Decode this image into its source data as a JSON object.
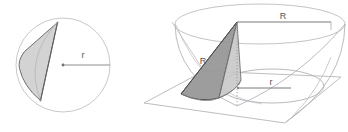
{
  "figure": {
    "background_color": "#ffffff",
    "panels": [
      {
        "id": "left-panel",
        "name": "circle-cross-section",
        "description": "Circle of radius r with inscribed cone cross-section shaded",
        "labels": [
          {
            "id": "radius-label",
            "text": "r",
            "x": 83,
            "y": 58
          }
        ]
      },
      {
        "id": "right-panel",
        "name": "hemisphere-with-cone",
        "description": "Hemispherical bowl of radius R cut by a plane, with inscribed cone",
        "labels": [
          {
            "id": "top-radius-label",
            "text": "R",
            "x": 282,
            "y": 18
          },
          {
            "id": "slant-label",
            "text": "R",
            "x": 203,
            "y": 62
          },
          {
            "id": "inner-radius-label",
            "text": "r",
            "x": 271,
            "y": 87
          }
        ]
      }
    ]
  },
  "colors": {
    "outline_light": "#b9b9bd",
    "outline_medium": "#8d8d92",
    "outline_dark": "#5d5d62",
    "shade_fill": "#c9c9c9",
    "shade_fill_light": "#d9d9d9",
    "shade_fill_dark": "#a9a9ad",
    "label_text": "#55555a",
    "dotted_line": "#a0a0a5",
    "background": "#ffffff"
  },
  "geometry": {
    "left_circle": {
      "center_x": 63,
      "center_y": 65,
      "radius": 47,
      "radius_line": {
        "x1": 63,
        "y1": 65,
        "x2": 110,
        "y2": 65
      },
      "cone_polygon": "57,22 25,52 21,58 19,65 22,77 29,89 41,100 40,99",
      "chord": {
        "x1": 57,
        "y1": 22,
        "x2": 40,
        "y2": 100
      }
    },
    "right_bowl": {
      "rim_center_x": 260,
      "rim_center_y": 24,
      "rim_rx": 85,
      "rim_ry": 20,
      "bowl_depth": 82,
      "apex_x": 237,
      "apex_y": 22,
      "inner_ellipse": {
        "cx": 272,
        "cy": 86,
        "rx": 52,
        "ry": 17
      },
      "top_radius_line": {
        "x1": 237,
        "y1": 22,
        "x2": 330,
        "y2": 22
      },
      "inner_radius_line": {
        "x1": 238,
        "y1": 88,
        "x2": 290,
        "y2": 88
      },
      "axis_dotted": {
        "x1": 237,
        "y1": 23,
        "x2": 237,
        "y2": 104
      },
      "plane_polygon": "144,103 203,72 341,77 285,122"
    }
  }
}
